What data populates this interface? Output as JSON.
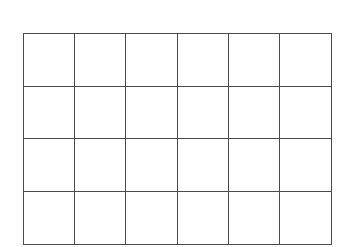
{
  "grid": {
    "rows": 4,
    "columns": 6,
    "line_color": "#4a4a4a",
    "background": "#ffffff",
    "cells": [
      [
        "",
        "",
        "",
        "",
        "",
        ""
      ],
      [
        "",
        "",
        "",
        "",
        "",
        ""
      ],
      [
        "",
        "",
        "",
        "",
        "",
        ""
      ],
      [
        "",
        "",
        "",
        "",
        "",
        ""
      ]
    ]
  }
}
